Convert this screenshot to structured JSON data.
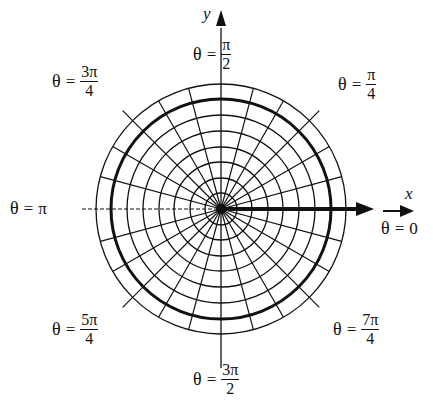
{
  "diagram": {
    "type": "polar-grid",
    "center": {
      "x": 221,
      "y": 209
    },
    "circles": {
      "radii": [
        16,
        31,
        47,
        62,
        78,
        94,
        110,
        125
      ],
      "highlighted_radius": 110
    },
    "radial_lines": {
      "step_degrees": 15,
      "length": 125
    },
    "colors": {
      "ink": "#111111",
      "background": "#ffffff"
    }
  },
  "axes": {
    "x_label": "x",
    "y_label": "y"
  },
  "angle_labels": [
    {
      "id": "theta-0",
      "theta": "θ",
      "eq": "=",
      "value": "0"
    },
    {
      "id": "theta-pi-4",
      "theta": "θ",
      "eq": "=",
      "num": "π",
      "den": "4"
    },
    {
      "id": "theta-pi-2",
      "theta": "θ",
      "eq": "=",
      "num": "π",
      "den": "2"
    },
    {
      "id": "theta-3pi-4",
      "theta": "θ",
      "eq": "=",
      "num": "3π",
      "den": "4"
    },
    {
      "id": "theta-pi",
      "theta": "θ",
      "eq": "=",
      "value": "π"
    },
    {
      "id": "theta-5pi-4",
      "theta": "θ",
      "eq": "=",
      "num": "5π",
      "den": "4"
    },
    {
      "id": "theta-3pi-2",
      "theta": "θ",
      "eq": "=",
      "num": "3π",
      "den": "2"
    },
    {
      "id": "theta-7pi-4",
      "theta": "θ",
      "eq": "=",
      "num": "7π",
      "den": "4"
    }
  ]
}
